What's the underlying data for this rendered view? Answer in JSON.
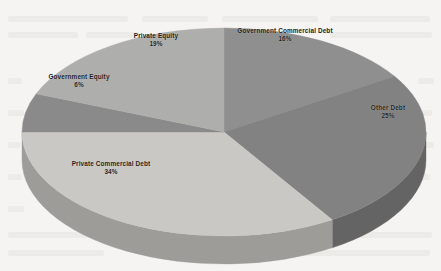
{
  "chart_data": {
    "type": "pie",
    "title": "",
    "subtitle": "",
    "xlabel": "",
    "ylabel": "",
    "three_d": true,
    "legend_position": "none",
    "labels_position": "inside-slices",
    "grid": false,
    "total_pct": 100,
    "categories": [
      "Government Commercial Debt",
      "Other Debt",
      "Private Commercial Debt",
      "Government Equity",
      "Private Equity"
    ],
    "values": [
      16,
      25,
      34,
      6,
      19
    ],
    "slices": [
      {
        "name": "Government Commercial Debt",
        "value": 16,
        "pct_label": "16%",
        "color": "#8f8f8f",
        "side_color": "#6f6f6f",
        "start_deg": 0,
        "end_deg": 57.6
      },
      {
        "name": "Other Debt",
        "value": 25,
        "pct_label": "25%",
        "color": "#828282",
        "side_color": "#646464",
        "start_deg": 57.6,
        "end_deg": 147.6
      },
      {
        "name": "Private Commercial Debt",
        "value": 34,
        "pct_label": "34%",
        "color": "#c9c8c5",
        "side_color": "#9d9c99",
        "start_deg": 147.6,
        "end_deg": 270.0
      },
      {
        "name": "Government Equity",
        "value": 6,
        "pct_label": "6%",
        "color": "#8a8a8a",
        "side_color": "#6b6b6b",
        "start_deg": 270.0,
        "end_deg": 291.6
      },
      {
        "name": "Private Equity",
        "value": 19,
        "pct_label": "19%",
        "color": "#aeaeac",
        "side_color": "#8a8a88",
        "start_deg": 291.6,
        "end_deg": 360.0
      }
    ],
    "geometry": {
      "center_x": 224,
      "center_y": 132,
      "radius_x": 202,
      "radius_y": 104,
      "depth": 28
    },
    "background_color": "#f5f4f2"
  },
  "labels": {
    "government_commercial_debt": {
      "name": "Government Commercial Debt",
      "pct": "16%"
    },
    "other_debt": {
      "name": "Other Debt",
      "pct": "25%"
    },
    "private_commercial_debt": {
      "name": "Private Commercial Debt",
      "pct": "34%"
    },
    "government_equity": {
      "name": "Government Equity",
      "pct": "6%"
    },
    "private_equity": {
      "name": "Private Equity",
      "pct": "19%"
    }
  }
}
